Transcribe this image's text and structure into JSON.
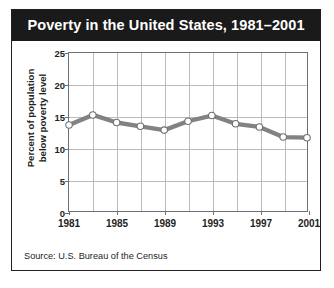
{
  "title": "Poverty in the United States, 1981–2001",
  "source": "Source: U.S. Bureau of the Census",
  "colors": {
    "title_bar": "#1a1a1a",
    "title_text": "#ffffff",
    "frame": "#231f20",
    "grid": "#b9bbbd",
    "axis": "#6f7072",
    "series_line": "#808285",
    "marker_fill": "#ffffff",
    "marker_stroke": "#6f7072",
    "plot_background": "#ffffff"
  },
  "chart_data": {
    "type": "line",
    "title": "Poverty in the United States, 1981–2001",
    "xlabel": "",
    "ylabel": "Percent of population below poverty level",
    "x": [
      1981,
      1983,
      1985,
      1987,
      1989,
      1991,
      1993,
      1995,
      1997,
      1999,
      2001
    ],
    "values": [
      13.6,
      15.2,
      14.0,
      13.4,
      12.8,
      14.2,
      15.1,
      13.8,
      13.3,
      11.7,
      11.6
    ],
    "series": [
      {
        "name": "Percent of population below poverty level",
        "values": [
          13.6,
          15.2,
          14.0,
          13.4,
          12.8,
          14.2,
          15.1,
          13.8,
          13.3,
          11.7,
          11.6
        ]
      }
    ],
    "xlim": [
      1981,
      2001
    ],
    "ylim": [
      0,
      25
    ],
    "yticks": [
      0,
      5,
      10,
      15,
      20,
      25
    ],
    "ytick_labels": [
      "0",
      "5",
      "10",
      "15",
      "20",
      "25"
    ],
    "xticks": [
      1981,
      1985,
      1989,
      1993,
      1997,
      2001
    ],
    "xtick_labels": [
      "1981",
      "1985",
      "1989",
      "1993",
      "1997",
      "2001"
    ],
    "grid": true,
    "grid_axis": "both",
    "legend": false,
    "legend_position": "none",
    "marker": "circle",
    "annotations": []
  },
  "y_axis": {
    "label_line1": "Percent of population",
    "label_line2": "below poverty level",
    "ticks": [
      "0",
      "5",
      "10",
      "15",
      "20",
      "25"
    ]
  },
  "x_axis": {
    "ticks": [
      "1981",
      "1985",
      "1989",
      "1993",
      "1997",
      "2001"
    ]
  }
}
